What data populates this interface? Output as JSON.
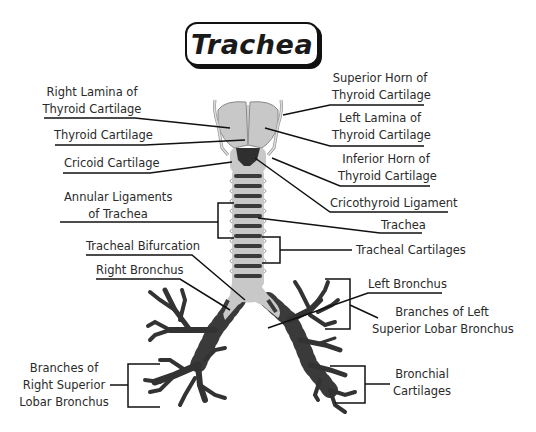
{
  "title": "Trachea",
  "colors": {
    "cartilage": "#c8c8c8",
    "ring_dark": "#3a3a3a",
    "line": "#111111",
    "text": "#2a2a2a"
  },
  "labels": {
    "right_lamina": [
      "Right Lamina of",
      "Thyroid Cartilage"
    ],
    "thyroid_cartilage": [
      "Thyroid Cartilage"
    ],
    "cricoid_cartilage": [
      "Cricoid Cartilage"
    ],
    "annular_ligaments": [
      "Annular Ligaments",
      "of Trachea"
    ],
    "tracheal_bifurcation": [
      "Tracheal Bifurcation"
    ],
    "right_bronchus": [
      "Right Bronchus"
    ],
    "branches_right": [
      "Branches of",
      "Right Superior",
      "Lobar Bronchus"
    ],
    "superior_horn": [
      "Superior Horn of",
      "Thyroid Cartilage"
    ],
    "left_lamina": [
      "Left Lamina of",
      "Thyroid Cartilage"
    ],
    "inferior_horn": [
      "Inferior Horn of",
      "Thyroid Cartilage"
    ],
    "cricothyroid_ligament": [
      "Cricothyroid Ligament"
    ],
    "trachea": [
      "Trachea"
    ],
    "tracheal_cartilages": [
      "Tracheal Cartilages"
    ],
    "left_bronchus": [
      "Left Bronchus"
    ],
    "branches_left": [
      "Branches of Left",
      "Superior Lobar Bronchus"
    ],
    "bronchial_cartilages": [
      "Bronchial",
      "Cartilages"
    ]
  }
}
